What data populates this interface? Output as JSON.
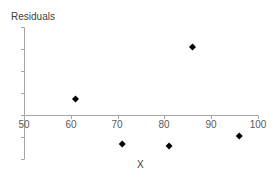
{
  "chart_data": {
    "type": "scatter",
    "title": "",
    "xlabel": "X",
    "ylabel": "Residuals",
    "xlim": [
      50,
      100
    ],
    "x_ticks": [
      50,
      60,
      70,
      80,
      90,
      100
    ],
    "x_tick_labels": [
      "50",
      "60",
      "70",
      "80",
      "90",
      "100"
    ],
    "y_tick_labels_shown": false,
    "ylim_units": [
      -2,
      4
    ],
    "grid": false,
    "legend": null,
    "marker": "diamond",
    "marker_color": "#000000",
    "series": [
      {
        "name": "Residuals",
        "x": [
          61,
          71,
          81,
          86,
          96
        ],
        "y": [
          0.73,
          -1.32,
          -1.41,
          3.09,
          -0.95
        ]
      }
    ]
  },
  "labels": {
    "ylabel": "Residuals",
    "xlabel": "X",
    "ticks": [
      "50",
      "60",
      "70",
      "80",
      "90",
      "100"
    ]
  }
}
